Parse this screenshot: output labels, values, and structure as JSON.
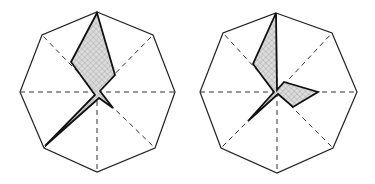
{
  "figure": {
    "colors": {
      "outline": "#222222",
      "axis": "#333333",
      "fill": "#d8d8d8",
      "hatch": "#9a9a9a",
      "polygon_stroke": "#111111"
    }
  },
  "glyphs": [
    {
      "id": "left",
      "center": [
        97,
        92
      ],
      "octagon": [
        [
          97,
          12
        ],
        [
          153,
          35
        ],
        [
          175,
          92
        ],
        [
          155,
          148
        ],
        [
          97,
          172
        ],
        [
          44,
          148
        ],
        [
          20,
          92
        ],
        [
          42,
          35
        ]
      ],
      "polygon": [
        [
          97,
          13
        ],
        [
          115,
          75
        ],
        [
          100,
          91
        ],
        [
          113,
          108
        ],
        [
          99,
          98
        ],
        [
          45,
          146
        ],
        [
          95,
          95
        ],
        [
          71,
          62
        ]
      ]
    },
    {
      "id": "right",
      "center": [
        277,
        92
      ],
      "octagon": [
        [
          276,
          13
        ],
        [
          332,
          33
        ],
        [
          357,
          92
        ],
        [
          333,
          148
        ],
        [
          277,
          173
        ],
        [
          221,
          148
        ],
        [
          200,
          92
        ],
        [
          223,
          33
        ]
      ],
      "polygon": [
        [
          276,
          13
        ],
        [
          277,
          90
        ],
        [
          284,
          82
        ],
        [
          318,
          92
        ],
        [
          293,
          107
        ],
        [
          278,
          94
        ],
        [
          248,
          121
        ],
        [
          274,
          92
        ],
        [
          253,
          64
        ]
      ]
    }
  ]
}
